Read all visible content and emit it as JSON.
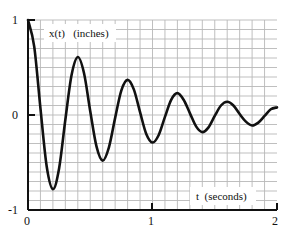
{
  "chart_data": {
    "type": "line",
    "title": "",
    "xlabel": "t  (seconds)",
    "ylabel": "x(t)   (inches)",
    "xlim": [
      0,
      2
    ],
    "ylim": [
      -1,
      1
    ],
    "x_ticks": [
      0,
      1,
      2
    ],
    "x_tick_labels": [
      "0",
      "1",
      "2"
    ],
    "y_ticks": [
      -1,
      0,
      1
    ],
    "y_tick_labels": [
      "-1",
      "0",
      "1"
    ],
    "grid": true,
    "grid_step_x": 0.1,
    "grid_step_y": 0.1,
    "legend": null,
    "series": [
      {
        "name": "x(t)",
        "color": "#111111",
        "x": [
          0,
          0.05,
          0.1,
          0.15,
          0.2,
          0.25,
          0.3,
          0.35,
          0.4,
          0.45,
          0.5,
          0.55,
          0.6,
          0.65,
          0.7,
          0.75,
          0.8,
          0.85,
          0.9,
          0.95,
          1.0,
          1.05,
          1.1,
          1.15,
          1.2,
          1.25,
          1.3,
          1.35,
          1.4,
          1.45,
          1.5,
          1.55,
          1.6,
          1.65,
          1.7,
          1.75,
          1.8,
          1.85,
          1.9,
          1.95,
          2.0
        ],
        "y": [
          1.0,
          0.72,
          0.07,
          -0.54,
          -0.78,
          -0.56,
          -0.05,
          0.42,
          0.61,
          0.44,
          0.04,
          -0.33,
          -0.48,
          -0.34,
          -0.03,
          0.26,
          0.37,
          0.27,
          0.03,
          -0.2,
          -0.29,
          -0.21,
          -0.02,
          0.16,
          0.23,
          0.16,
          0.02,
          -0.12,
          -0.18,
          -0.13,
          -0.01,
          0.1,
          0.14,
          0.1,
          0.01,
          -0.07,
          -0.11,
          -0.08,
          -0.01,
          0.06,
          0.08
        ]
      }
    ]
  },
  "colors": {
    "curve": "#111111",
    "axis": "#111111",
    "grid": "#b8b8b8",
    "background": "#ffffff"
  }
}
